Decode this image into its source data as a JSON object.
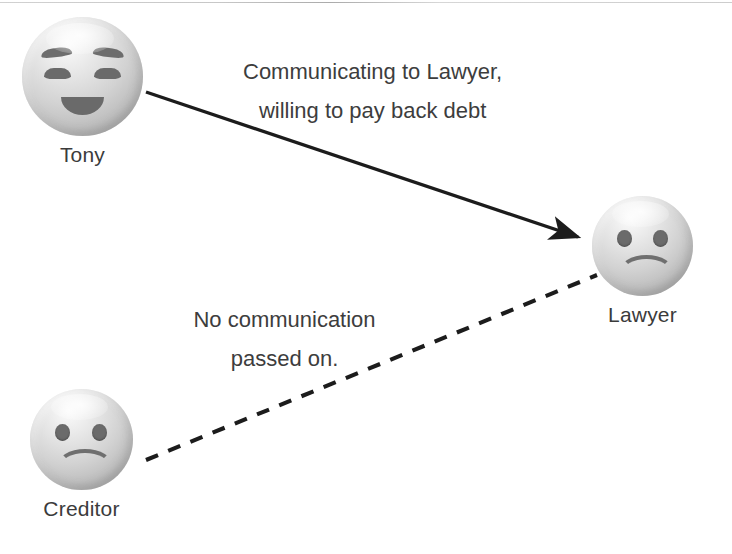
{
  "diagram": {
    "type": "communication-flow",
    "background_color": "#ffffff",
    "line_color": "#1c1c1c",
    "text_color": "#3d3d3d",
    "nodes": [
      {
        "id": "tony",
        "label": "Tony",
        "icon": "smiling-face-with-smiling-eyes",
        "expression": "happy",
        "x": 22,
        "y": 17,
        "size": 121
      },
      {
        "id": "lawyer",
        "label": "Lawyer",
        "icon": "frowning-face",
        "expression": "sad",
        "x": 592,
        "y": 196,
        "size": 101
      },
      {
        "id": "creditor",
        "label": "Creditor",
        "icon": "frowning-face",
        "expression": "sad",
        "x": 30,
        "y": 389,
        "size": 103
      }
    ],
    "edges": [
      {
        "id": "tony-to-lawyer",
        "from": "tony",
        "to": "lawyer",
        "style": "solid",
        "arrow": "single",
        "label_line1": "Communicating to Lawyer,",
        "label_line2": "willing to pay back debt"
      },
      {
        "id": "creditor-to-lawyer",
        "from": "creditor",
        "to": "lawyer",
        "style": "dashed",
        "arrow": "none",
        "label_line1": "No communication",
        "label_line2": "passed on."
      }
    ]
  }
}
